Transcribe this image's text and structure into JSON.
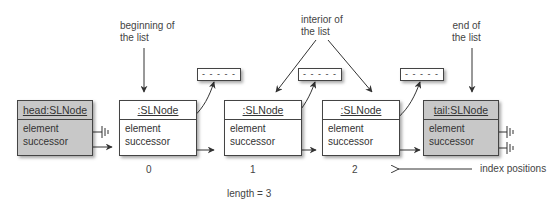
{
  "annotations": {
    "beginning": [
      "beginning of",
      "the list"
    ],
    "interior": [
      "interior of",
      "the list"
    ],
    "end": [
      "end of",
      "the list"
    ],
    "index_positions": "index positions",
    "length": "length = 3"
  },
  "nodes": [
    {
      "title": "head:SLNode",
      "fields": [
        "element",
        "successor"
      ],
      "style": "shaded",
      "index": ""
    },
    {
      "title": ":SLNode",
      "fields": [
        "element",
        "successor"
      ],
      "style": "plain",
      "index": "0"
    },
    {
      "title": ":SLNode",
      "fields": [
        "element",
        "successor"
      ],
      "style": "plain",
      "index": "1"
    },
    {
      "title": ":SLNode",
      "fields": [
        "element",
        "successor"
      ],
      "style": "plain",
      "index": "2"
    },
    {
      "title": "tail:SLNode",
      "fields": [
        "element",
        "successor"
      ],
      "style": "shaded",
      "index": ""
    }
  ],
  "element_boxes": [
    "- - - - -",
    "- - - - -",
    "- - - - -"
  ]
}
